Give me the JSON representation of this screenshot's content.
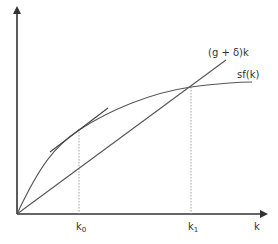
{
  "diagram": {
    "type": "solow-growth-model",
    "colors": {
      "axis": "#333333",
      "curve": "#555555",
      "line": "#555555",
      "tangent": "#444444",
      "dashed": "#999999",
      "text": "#333333"
    },
    "axes": {
      "x_label": "k",
      "y_label": ""
    },
    "curves": {
      "production": {
        "label": "sf(k)"
      },
      "break_even": {
        "label_main": "(g + δ)k"
      }
    },
    "ticks": {
      "k0": {
        "base": "k",
        "sub": "0"
      },
      "k1": {
        "base": "k",
        "sub": "1"
      }
    }
  }
}
